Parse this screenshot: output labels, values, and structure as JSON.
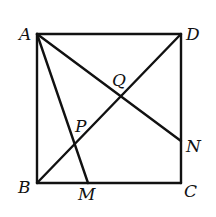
{
  "diagram": {
    "type": "geometry",
    "shape": "square ABCD",
    "points": {
      "A": {
        "label": "A",
        "x": 37,
        "y": 34
      },
      "D": {
        "label": "D",
        "x": 181,
        "y": 34
      },
      "B": {
        "label": "B",
        "x": 37,
        "y": 183
      },
      "C": {
        "label": "C",
        "x": 181,
        "y": 183
      },
      "M": {
        "label": "M",
        "x": 88,
        "y": 183
      },
      "N": {
        "label": "N",
        "x": 181,
        "y": 141
      },
      "P": {
        "label": "P",
        "x": 75,
        "y": 143
      },
      "Q": {
        "label": "Q",
        "x": 120,
        "y": 96
      }
    },
    "segments": [
      "AB",
      "BC",
      "CD",
      "DA",
      "BD",
      "AM",
      "AN"
    ],
    "labels": [
      {
        "text": "A",
        "x": 19,
        "y": 40
      },
      {
        "text": "D",
        "x": 186,
        "y": 40
      },
      {
        "text": "B",
        "x": 18,
        "y": 193
      },
      {
        "text": "C",
        "x": 184,
        "y": 197
      },
      {
        "text": "M",
        "x": 78,
        "y": 200
      },
      {
        "text": "N",
        "x": 186,
        "y": 152
      },
      {
        "text": "P",
        "x": 75,
        "y": 132
      },
      {
        "text": "Q",
        "x": 112,
        "y": 86
      }
    ]
  }
}
